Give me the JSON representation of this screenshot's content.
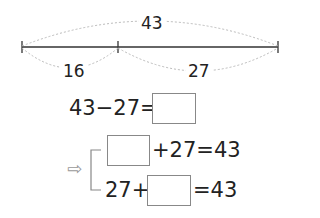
{
  "segment_diagram": {
    "total_label": "43",
    "left_part_label": "16",
    "right_part_label": "27"
  },
  "equations": {
    "row1": {
      "left": "43−27=",
      "answer_box": ""
    },
    "row2": {
      "answer_box": "",
      "right": "+27=43"
    },
    "row3": {
      "left": "27+",
      "answer_box": "",
      "right": "=43"
    }
  },
  "icons": {
    "arrow": "⇨"
  },
  "colors": {
    "line": "#333333",
    "dotted_arc": "#bbbbbb",
    "box_border": "#888888"
  }
}
